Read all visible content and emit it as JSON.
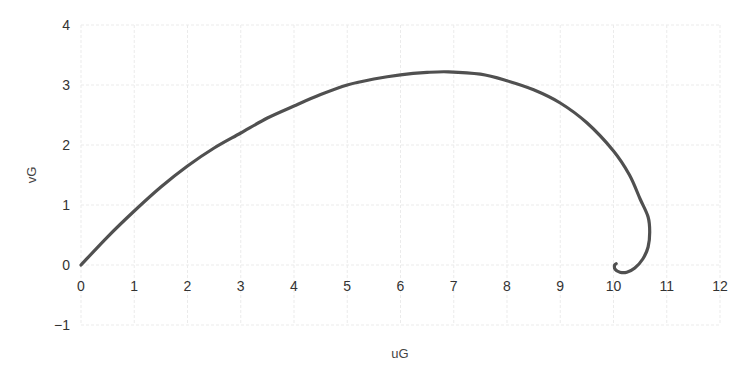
{
  "chart_data": {
    "type": "line",
    "title": "",
    "xlabel": "uG",
    "ylabel": "vG",
    "xlim": [
      0,
      12
    ],
    "ylim": [
      -1,
      4
    ],
    "xticks": [
      0,
      1,
      2,
      3,
      4,
      5,
      6,
      7,
      8,
      9,
      10,
      11,
      12
    ],
    "yticks": [
      -1,
      0,
      1,
      2,
      3,
      4
    ],
    "xtick_labels": [
      "0",
      "1",
      "2",
      "3",
      "4",
      "5",
      "6",
      "7",
      "8",
      "9",
      "10",
      "11",
      "12"
    ],
    "ytick_labels": [
      "−1",
      "0",
      "1",
      "2",
      "3",
      "4"
    ],
    "grid": true,
    "legend": null,
    "line_color": "#505050",
    "series": [
      {
        "name": "trajectory",
        "x": [
          0,
          0.5,
          1,
          1.5,
          2,
          2.5,
          3,
          3.5,
          4,
          4.5,
          5,
          5.5,
          6,
          6.5,
          6.9,
          7.5,
          8,
          8.5,
          9,
          9.5,
          10,
          10.3,
          10.5,
          10.65,
          10.68,
          10.65,
          10.55,
          10.4,
          10.25,
          10.12,
          10.03,
          10.02,
          10.05
        ],
        "y": [
          0,
          0.47,
          0.9,
          1.3,
          1.65,
          1.95,
          2.2,
          2.45,
          2.65,
          2.84,
          3.0,
          3.1,
          3.17,
          3.21,
          3.22,
          3.18,
          3.07,
          2.92,
          2.7,
          2.37,
          1.9,
          1.5,
          1.1,
          0.8,
          0.55,
          0.3,
          0.1,
          -0.05,
          -0.12,
          -0.12,
          -0.07,
          0.0,
          0.02
        ]
      }
    ]
  },
  "axes": {
    "x_label": "uG",
    "y_label": "vG"
  }
}
